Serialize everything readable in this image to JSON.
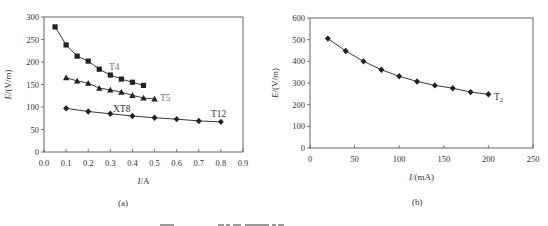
{
  "chart_data": [
    {
      "type": "line",
      "panel": "(a)",
      "xlabel": "I/A",
      "ylabel": "E/(V/m)",
      "xlim": [
        0,
        0.9
      ],
      "ylim": [
        0,
        300
      ],
      "xticks": [
        "0.0",
        "0.1",
        "0.2",
        "0.3",
        "0.4",
        "0.5",
        "0.6",
        "0.7",
        "0.8",
        "0.9"
      ],
      "yticks": [
        "0",
        "50",
        "100",
        "150",
        "200",
        "250",
        "300"
      ],
      "grid": false,
      "series": [
        {
          "name": "T4",
          "marker": "square",
          "x": [
            0.05,
            0.1,
            0.15,
            0.2,
            0.25,
            0.3,
            0.35,
            0.4,
            0.45
          ],
          "values": [
            278,
            238,
            213,
            202,
            184,
            171,
            162,
            155,
            148
          ]
        },
        {
          "name": "T5",
          "marker": "triangle",
          "x": [
            0.1,
            0.15,
            0.2,
            0.25,
            0.3,
            0.35,
            0.4,
            0.45,
            0.5
          ],
          "values": [
            165,
            158,
            153,
            142,
            138,
            133,
            126,
            120,
            118
          ]
        },
        {
          "name": "XT8 / T12",
          "marker": "diamond",
          "x": [
            0.1,
            0.2,
            0.3,
            0.4,
            0.5,
            0.6,
            0.7,
            0.8
          ],
          "values": [
            97,
            90,
            85,
            80,
            76,
            73,
            69,
            67
          ]
        }
      ],
      "annotations": [
        "T4",
        "T5",
        "XT8",
        "T12"
      ]
    },
    {
      "type": "line",
      "panel": "(b)",
      "xlabel": "I/(mA)",
      "ylabel": "E/(V/m)",
      "xlim": [
        0,
        250
      ],
      "ylim": [
        0,
        600
      ],
      "xticks": [
        "0",
        "50",
        "100",
        "150",
        "200",
        "250"
      ],
      "yticks": [
        "0",
        "100",
        "200",
        "300",
        "400",
        "500",
        "600"
      ],
      "grid": false,
      "series": [
        {
          "name": "T2",
          "marker": "diamond",
          "x": [
            20,
            40,
            60,
            80,
            100,
            120,
            140,
            160,
            180,
            200
          ],
          "values": [
            505,
            448,
            400,
            361,
            331,
            307,
            289,
            276,
            258,
            248
          ]
        }
      ],
      "annotations": [
        "T2"
      ]
    }
  ],
  "labels": {
    "a": {
      "xlabel_i": "I",
      "xlabel_rest": "/A",
      "ylabel_e": "E",
      "ylabel_rest": "/(V/m)",
      "caption": "(a)",
      "t4": "T4",
      "t5": "T5",
      "xt8": "XT8",
      "t12": "T12"
    },
    "b": {
      "xlabel_i": "I",
      "xlabel_rest": "/(mA)",
      "ylabel_e": "E",
      "ylabel_rest": "/(V/m)",
      "caption": "(b)",
      "t2": "T",
      "t2_sub": "2"
    }
  },
  "colors": {
    "axis": "#555555",
    "line": "#222222",
    "label_gray": "#777777"
  }
}
